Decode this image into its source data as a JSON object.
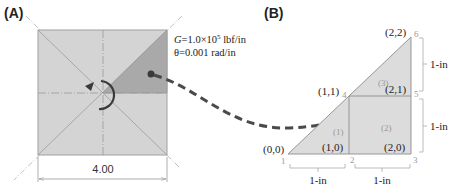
{
  "panel_a": {
    "label": "(A)",
    "shear_modulus": "G=1.0×10⁵ lbf/in",
    "shear_modulus_parts": {
      "symbol": "G",
      "value": "=1.0×10",
      "exponent": "5",
      "unit": " lbf/in"
    },
    "twist": "θ=0.001 rad/in",
    "dimension": "4.00",
    "icons": [
      "rotation-arrow-icon",
      "dashed-curved-arrow-icon"
    ],
    "colors": {
      "fill": "#d4d4d4",
      "highlight": "#a9a9a9",
      "stroke": "#9a9a9a",
      "arrow": "#4a4a4a"
    }
  },
  "panel_b": {
    "label": "(B)",
    "nodes": [
      {
        "num": "1",
        "coord": "(0,0)"
      },
      {
        "num": "2",
        "coord": "(1,0)"
      },
      {
        "num": "3",
        "coord": "(2,0)"
      },
      {
        "num": "4",
        "coord": "(1,1)"
      },
      {
        "num": "5",
        "coord": "(2,1)"
      },
      {
        "num": "6",
        "coord": "(2,2)"
      }
    ],
    "elements": [
      "(1)",
      "(2)",
      "(3)"
    ],
    "dimensions": {
      "bottom_left": "1-in",
      "bottom_right": "1-in",
      "right_lower": "1-in",
      "right_upper": "1-in"
    },
    "colors": {
      "fill": "#dcdcdc",
      "stroke": "#8c8c8c"
    }
  }
}
